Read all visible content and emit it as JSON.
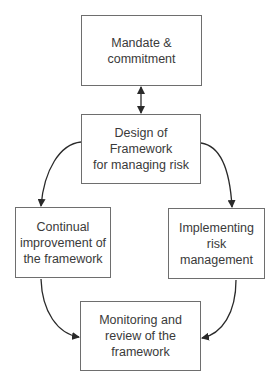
{
  "diagram": {
    "type": "flowchart",
    "nodes": [
      {
        "id": "mandate",
        "label": "Mandate &\ncommitment"
      },
      {
        "id": "design",
        "label": "Design of Framework\nfor managing risk"
      },
      {
        "id": "improvement",
        "label": "Continual\nimprovement of\nthe framework"
      },
      {
        "id": "implementing",
        "label": "Implementing\nrisk\nmanagement"
      },
      {
        "id": "monitoring",
        "label": "Monitoring and\nreview of the\nframework"
      }
    ],
    "edges": [
      {
        "from": "mandate",
        "to": "design",
        "style": "straight",
        "bidirectional": true
      },
      {
        "from": "design",
        "to": "improvement",
        "style": "curved"
      },
      {
        "from": "design",
        "to": "implementing",
        "style": "curved"
      },
      {
        "from": "improvement",
        "to": "monitoring",
        "style": "curved"
      },
      {
        "from": "implementing",
        "to": "monitoring",
        "style": "curved"
      }
    ],
    "colors": {
      "border": "#6e6e6e",
      "text": "#3a3a3a",
      "arrow": "#2a2a2a",
      "background": "#ffffff"
    }
  }
}
